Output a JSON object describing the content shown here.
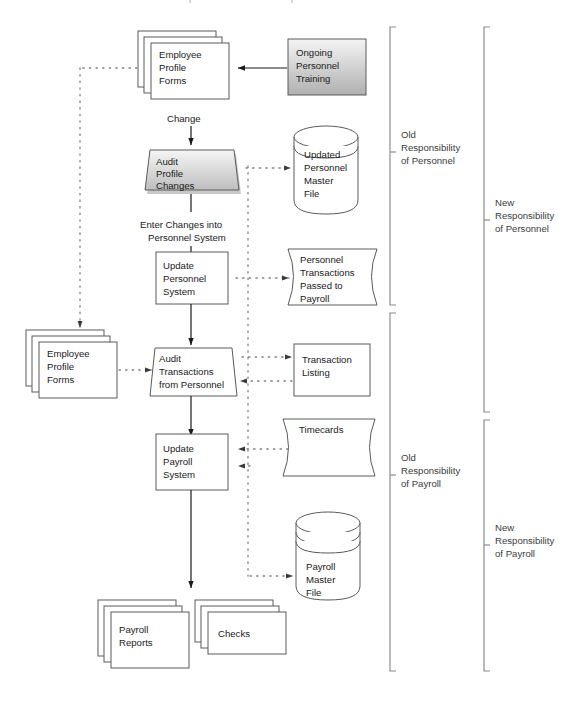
{
  "diagram": {
    "colors": {
      "outline": "#5a5a5a",
      "solid_arrow": "#1a1a1a",
      "dotted_arrow": "#808080",
      "bracket": "#8c8c8c",
      "text": "#1a1a1a",
      "bracket_text": "#3c3c3c",
      "gradient_light": "#f2f2f2",
      "gradient_dark": "#b4b4b4",
      "shadow": "#9a9a9a"
    },
    "nodes": {
      "employee_profile_forms_top": {
        "label": "Employee\nProfile\nForms",
        "lines": [
          "Employee",
          "Profile",
          "Forms"
        ],
        "shape": "multi-document"
      },
      "ongoing_personnel_training": {
        "label": "Ongoing\nPersonnel\nTraining",
        "lines": [
          "Ongoing",
          "Personnel",
          "Training"
        ],
        "shape": "gradient-box"
      },
      "audit_profile_changes": {
        "label": "Audit\nProfile\nChanges",
        "lines": [
          "Audit",
          "Profile",
          "Changes"
        ],
        "shape": "manual-operation-gradient"
      },
      "updated_personnel_master_file": {
        "label": "Updated\nPersonnel\nMaster\nFile",
        "lines": [
          "Updated",
          "Personnel",
          "Master",
          "File"
        ],
        "shape": "cylinder"
      },
      "update_personnel_system": {
        "label": "Update\nPersonnel\nSystem",
        "lines": [
          "Update",
          "Personnel",
          "System"
        ],
        "shape": "process-box"
      },
      "personnel_transactions_passed_to_payroll": {
        "label": "Personnel\nTransactions\nPassed to\nPayroll",
        "lines": [
          "Personnel",
          "Transactions",
          "Passed to",
          "Payroll"
        ],
        "shape": "stored-data"
      },
      "employee_profile_forms_left": {
        "label": "Employee\nProfile\nForms",
        "lines": [
          "Employee",
          "Profile",
          "Forms"
        ],
        "shape": "multi-document"
      },
      "audit_transactions_from_personnel": {
        "label": "Audit\nTransactions\nfrom Personnel",
        "lines": [
          "Audit",
          "Transactions",
          "from Personnel"
        ],
        "shape": "manual-operation"
      },
      "transaction_listing": {
        "label": "Transaction\nListing",
        "lines": [
          "Transaction",
          "Listing"
        ],
        "shape": "box"
      },
      "update_payroll_system": {
        "label": "Update\nPayroll\nSystem",
        "lines": [
          "Update",
          "Payroll",
          "System"
        ],
        "shape": "process-box"
      },
      "timecards": {
        "label": "Timecards",
        "lines": [
          "Timecards"
        ],
        "shape": "stored-data"
      },
      "payroll_master_file": {
        "label": "Payroll\nMaster\nFile",
        "lines": [
          "Payroll",
          "Master",
          "File"
        ],
        "shape": "multi-disk-cylinder"
      },
      "payroll_reports": {
        "label": "Payroll\nReports",
        "lines": [
          "Payroll",
          "Reports"
        ],
        "shape": "multi-document"
      },
      "checks": {
        "label": "Checks",
        "lines": [
          "Checks"
        ],
        "shape": "multi-document"
      }
    },
    "flow_labels": {
      "change": "Change",
      "enter_changes": [
        "Enter Changes into",
        "Personnel System"
      ]
    },
    "brackets": {
      "old_responsibility_of_personnel": {
        "lines": [
          "Old",
          "Responsibility",
          "of Personnel"
        ]
      },
      "new_responsibility_of_personnel": {
        "lines": [
          "New",
          "Responsibility",
          "of Personnel"
        ]
      },
      "old_responsibility_of_payroll": {
        "lines": [
          "Old",
          "Responsibility",
          "of Payroll"
        ]
      },
      "new_responsibility_of_payroll": {
        "lines": [
          "New",
          "Responsibility",
          "of Payroll"
        ]
      }
    }
  }
}
